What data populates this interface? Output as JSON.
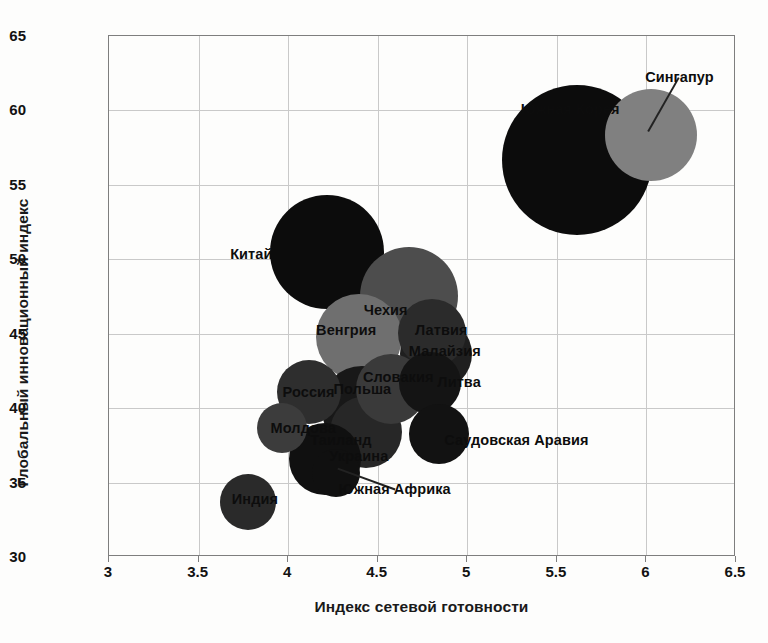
{
  "chart_data": {
    "type": "scatter",
    "title": "",
    "xlabel": "Индекс сетевой готовности",
    "ylabel": "Глобальный инновационный индекс",
    "xlim": [
      3,
      6.5
    ],
    "ylim": [
      30,
      65
    ],
    "xticks": [
      "3",
      "3.5",
      "4",
      "4.5",
      "5",
      "5.5",
      "6",
      "6.5"
    ],
    "yticks": [
      "30",
      "35",
      "40",
      "45",
      "50",
      "55",
      "60",
      "65"
    ],
    "grid": true,
    "legend": "none",
    "bubble_note": "Bubble area encodes a third (unlabeled) magnitude variable",
    "points": [
      {
        "label": "Сингапур",
        "x": 6.03,
        "y": 58.3,
        "size": 46,
        "color": "#808080",
        "label_x": 6.19,
        "label_y": 62.2,
        "leader": true,
        "leader_to_x": 6.02,
        "leader_to_y": 58.6
      },
      {
        "label": "Южная Корея",
        "x": 5.62,
        "y": 56.6,
        "size": 75,
        "color": "#0c0c0c",
        "label_x": 5.58,
        "label_y": 60.0,
        "leader": false
      },
      {
        "label": "Китай",
        "x": 4.22,
        "y": 50.4,
        "size": 57,
        "color": "#0c0c0c",
        "label_x": 3.8,
        "label_y": 50.3,
        "leader": false
      },
      {
        "label": "Чехия",
        "x": 4.68,
        "y": 47.5,
        "size": 49,
        "color": "#4d4d4d",
        "label_x": 4.55,
        "label_y": 46.5,
        "leader": false
      },
      {
        "label": "Венгрия",
        "x": 4.4,
        "y": 44.7,
        "size": 43,
        "color": "#6f6f6f",
        "label_x": 4.33,
        "label_y": 45.2,
        "leader": false
      },
      {
        "label": "Латвия",
        "x": 4.81,
        "y": 45.0,
        "size": 34,
        "color": "#2b2b2b",
        "label_x": 4.86,
        "label_y": 45.2,
        "leader": false
      },
      {
        "label": "Малайзия",
        "x": 4.83,
        "y": 43.6,
        "size": 36,
        "color": "#1f1f1f",
        "label_x": 4.88,
        "label_y": 43.8,
        "leader": false
      },
      {
        "label": "Литва",
        "x": 4.8,
        "y": 41.6,
        "size": 31,
        "color": "#141414",
        "label_x": 4.96,
        "label_y": 41.7,
        "leader": false
      },
      {
        "label": "Словакия",
        "x": 4.58,
        "y": 41.2,
        "size": 35,
        "color": "#3a3a3a",
        "label_x": 4.62,
        "label_y": 42.0,
        "leader": false
      },
      {
        "label": "Польша",
        "x": 4.42,
        "y": 40.0,
        "size": 41,
        "color": "#181818",
        "label_x": 4.42,
        "label_y": 41.2,
        "leader": false
      },
      {
        "label": "Россия",
        "x": 4.12,
        "y": 41.0,
        "size": 32,
        "color": "#2e2e2e",
        "label_x": 4.12,
        "label_y": 41.0,
        "leader": false
      },
      {
        "label": "Молдова",
        "x": 3.97,
        "y": 38.6,
        "size": 25,
        "color": "#3c3c3c",
        "label_x": 4.09,
        "label_y": 38.6,
        "leader": false
      },
      {
        "label": "Таиланд",
        "x": 4.44,
        "y": 38.3,
        "size": 36,
        "color": "#272727",
        "label_x": 4.3,
        "label_y": 37.8,
        "leader": false
      },
      {
        "label": "Саудовская Аравия",
        "x": 4.85,
        "y": 38.2,
        "size": 30,
        "color": "#121212",
        "label_x": 5.28,
        "label_y": 37.8,
        "leader": false
      },
      {
        "label": "Украина",
        "x": 4.21,
        "y": 36.5,
        "size": 36,
        "color": "#101010",
        "label_x": 4.4,
        "label_y": 36.7,
        "leader": false
      },
      {
        "label": "Южная Африка",
        "x": 4.27,
        "y": 35.6,
        "size": 24,
        "color": "#101010",
        "label_x": 4.6,
        "label_y": 34.5,
        "leader": true,
        "leader_to_x": 4.28,
        "leader_to_y": 35.9
      },
      {
        "label": "Индия",
        "x": 3.78,
        "y": 33.6,
        "size": 28,
        "color": "#2a2a2a",
        "label_x": 3.82,
        "label_y": 33.8,
        "leader": false
      }
    ]
  },
  "axes": {
    "x_title": "Индекс сетевой готовности",
    "y_title": "Глобальный инновационный индекс"
  }
}
